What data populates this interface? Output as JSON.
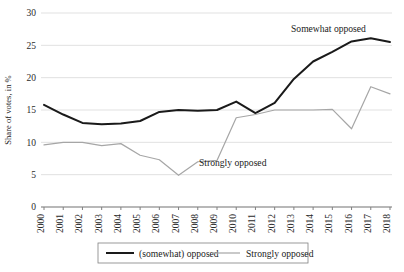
{
  "chart_data": {
    "type": "line",
    "title": "",
    "xlabel": "",
    "ylabel": "Share of votes, in %",
    "ylim": [
      0,
      30
    ],
    "yticks": [
      0,
      5,
      10,
      15,
      20,
      25,
      30
    ],
    "grid": true,
    "legend_position": "bottom",
    "categories": [
      "2000",
      "2001",
      "2002",
      "2003",
      "2004",
      "2005",
      "2006",
      "2007",
      "2008",
      "2009",
      "2010",
      "2011",
      "2012",
      "2013",
      "2014",
      "2015",
      "2016",
      "2017",
      "2018"
    ],
    "series": [
      {
        "name": "(somewhat) opposed",
        "color": "#1a1a1a",
        "values": [
          15.8,
          14.3,
          13.0,
          12.8,
          12.9,
          13.3,
          14.7,
          15.0,
          14.9,
          15.0,
          16.3,
          14.5,
          16.1,
          19.8,
          22.5,
          24.0,
          25.6,
          26.1,
          25.5
        ]
      },
      {
        "name": "Strongly opposed",
        "color": "#a6a6a6",
        "values": [
          9.6,
          10.0,
          10.0,
          9.5,
          9.8,
          8.0,
          7.3,
          4.9,
          7.0,
          7.2,
          13.8,
          14.3,
          15.0,
          15.0,
          15.0,
          15.1,
          12.1,
          18.6,
          17.5
        ]
      }
    ],
    "annotations": [
      {
        "text": "Somewhat opposed",
        "x": 291,
        "y": 32
      },
      {
        "text": "Strongly opposed",
        "x": 199,
        "y": 166
      }
    ],
    "legend": [
      {
        "label": "(somewhat) opposed",
        "color": "#1a1a1a"
      },
      {
        "label": "Strongly opposed",
        "color": "#a6a6a6"
      }
    ]
  }
}
